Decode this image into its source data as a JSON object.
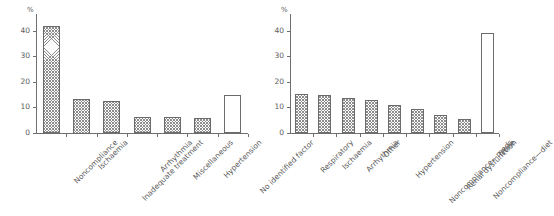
{
  "figure": {
    "background_color": "#ffffff",
    "bar_outline_color": "#6b6b6b",
    "hatch_color": "#8d8d8d",
    "axis_color": "#6f6f6f",
    "text_color": "#5a5a5a"
  },
  "chart_data": [
    {
      "type": "bar",
      "panel": "left",
      "title": "",
      "xlabel": "",
      "ylabel": "%",
      "ylim": [
        0,
        45
      ],
      "yticks": [
        0,
        10,
        20,
        30,
        40
      ],
      "ytick_labels": [
        "0",
        "10",
        "20",
        "30",
        "40"
      ],
      "grid": false,
      "legend": "none",
      "categories": [
        "Noncompliance",
        "Ischaemia",
        "Inadequate treatment",
        "Arrhythmia",
        "Miscellaneous",
        "Hypertension",
        "No identified factor"
      ],
      "values": [
        42,
        13.5,
        12.5,
        6.3,
        6.3,
        5.8,
        15
      ],
      "bar_styles": [
        "hatched",
        "hatched",
        "hatched",
        "hatched",
        "hatched",
        "hatched",
        "plain"
      ]
    },
    {
      "type": "bar",
      "panel": "right",
      "title": "",
      "xlabel": "",
      "ylabel": "%",
      "ylim": [
        0,
        45
      ],
      "yticks": [
        0,
        10,
        20,
        30,
        40
      ],
      "ytick_labels": [
        "0",
        "10",
        "20",
        "30",
        "40"
      ],
      "grid": false,
      "legend": "none",
      "categories": [
        "Respiratory",
        "Ischaemia",
        "Arrhythmia",
        "Other",
        "Hypertension",
        "Noncompliance—meds",
        "Renal dysfunction",
        "Noncompliance—diet",
        "None"
      ],
      "values": [
        15.3,
        14.7,
        13.6,
        12.8,
        10.8,
        9.2,
        7.1,
        5.4,
        39
      ],
      "bar_styles": [
        "hatched",
        "hatched",
        "hatched",
        "hatched",
        "hatched",
        "hatched",
        "hatched",
        "hatched",
        "plain"
      ]
    }
  ]
}
